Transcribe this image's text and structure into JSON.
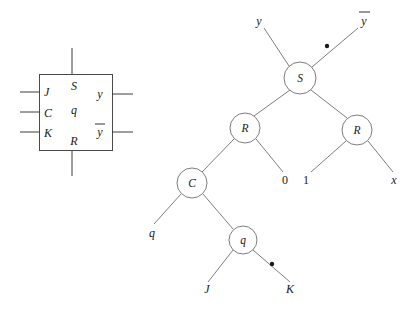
{
  "figure": {
    "ink_color": "#1a1a1a",
    "line_color": "#6e6e6e"
  },
  "flipflop": {
    "name": "jk-flip-flop-symbol",
    "inputs": [
      {
        "label": "J",
        "y": 92
      },
      {
        "label": "C",
        "y": 112
      },
      {
        "label": "K",
        "y": 132
      }
    ],
    "internal": [
      {
        "label": "S",
        "x": 78,
        "y": 86
      },
      {
        "label": "q",
        "x": 78,
        "y": 110
      },
      {
        "label": "R",
        "x": 78,
        "y": 141
      }
    ],
    "outputs": [
      {
        "label": "y",
        "y": 94,
        "bar": false
      },
      {
        "label": "y",
        "y": 132,
        "bar": true
      }
    ]
  },
  "tree": {
    "name": "expression-tree",
    "nodes": [
      {
        "id": "S",
        "label": "S",
        "cx": 300,
        "cy": 78,
        "r": 16
      },
      {
        "id": "R1",
        "label": "R",
        "cx": 245,
        "cy": 128,
        "r": 15
      },
      {
        "id": "R2",
        "label": "R",
        "cx": 357,
        "cy": 130,
        "r": 15
      },
      {
        "id": "C",
        "label": "C",
        "cx": 192,
        "cy": 183,
        "r": 15
      },
      {
        "id": "q",
        "label": "q",
        "cx": 243,
        "cy": 240,
        "r": 14
      }
    ],
    "leaves": [
      {
        "id": "leaf-y",
        "label": "y",
        "x": 259,
        "y": 22,
        "bar": false
      },
      {
        "id": "leaf-ybar",
        "label": "y",
        "x": 363,
        "y": 22,
        "bar": true
      },
      {
        "id": "leaf-0",
        "label": "0",
        "x": 285,
        "y": 182,
        "bar": false
      },
      {
        "id": "leaf-1",
        "label": "1",
        "x": 305,
        "y": 182,
        "bar": false
      },
      {
        "id": "leaf-x",
        "label": "x",
        "x": 391,
        "y": 182,
        "bar": false
      },
      {
        "id": "leaf-q",
        "label": "q",
        "x": 152,
        "y": 234,
        "bar": false
      },
      {
        "id": "leaf-J",
        "label": "J",
        "x": 207,
        "y": 291,
        "bar": false
      },
      {
        "id": "leaf-K",
        "label": "K",
        "x": 288,
        "y": 291,
        "bar": false
      }
    ],
    "negation_bubbles": [
      {
        "id": "bubble-ybar",
        "cx": 327,
        "cy": 46
      },
      {
        "id": "bubble-K",
        "cx": 272,
        "cy": 264
      }
    ],
    "edges": [
      {
        "from": "S",
        "to": "leaf-y"
      },
      {
        "from": "S",
        "to": "leaf-ybar"
      },
      {
        "from": "S",
        "to": "R1"
      },
      {
        "from": "S",
        "to": "R2"
      },
      {
        "from": "R1",
        "to": "C"
      },
      {
        "from": "R1",
        "to": "leaf-0"
      },
      {
        "from": "R2",
        "to": "leaf-1"
      },
      {
        "from": "R2",
        "to": "leaf-x"
      },
      {
        "from": "C",
        "to": "leaf-q"
      },
      {
        "from": "C",
        "to": "q"
      },
      {
        "from": "q",
        "to": "leaf-J"
      },
      {
        "from": "q",
        "to": "leaf-K"
      }
    ]
  }
}
